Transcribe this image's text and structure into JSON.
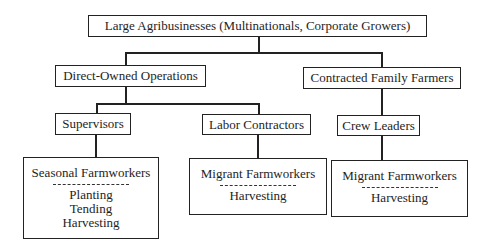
{
  "diagram": {
    "root": {
      "label": "Large Agribusinesses (Multinationals, Corporate Growers)"
    },
    "level1": [
      {
        "label": "Direct-Owned Operations"
      },
      {
        "label": "Contracted Family Farmers"
      }
    ],
    "level2": [
      {
        "label": "Supervisors"
      },
      {
        "label": "Labor Contractors"
      },
      {
        "label": "Crew Leaders"
      }
    ],
    "level3": [
      {
        "title": "Seasonal Farmworkers",
        "tasks": [
          "Planting",
          "Tending",
          "Harvesting"
        ]
      },
      {
        "title": "Migrant Farmworkers",
        "tasks": [
          "Harvesting"
        ]
      },
      {
        "title": "Migrant Farmworkers",
        "tasks": [
          "Harvesting"
        ]
      }
    ],
    "colors": {
      "line": "#222222",
      "background": "#ffffff",
      "text": "#1e1e1e"
    }
  }
}
